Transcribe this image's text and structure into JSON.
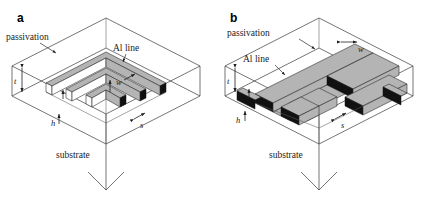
{
  "figure": {
    "kind": "schematic-diagram",
    "colors": {
      "line_top": "#b4b4b4",
      "line_front": "#111111",
      "line_side": "#ffffff",
      "outline": "#2e2e2e",
      "text": "#1a1a1a",
      "background": "#ffffff"
    }
  },
  "panels": [
    {
      "letter": "a",
      "layout": "nested-square-serpentine",
      "labels": {
        "passivation": "passivation",
        "al_line": "Al line",
        "substrate": "substrate"
      },
      "dimensions": {
        "thickness": "t",
        "width": "w",
        "height": "h",
        "spacing": "s"
      }
    },
    {
      "letter": "b",
      "layout": "parallel-straight-serpentine",
      "labels": {
        "passivation": "passivation",
        "al_line": "Al line",
        "substrate": "substrate"
      },
      "dimensions": {
        "thickness": "t",
        "width": "w",
        "height": "h",
        "spacing": "s"
      }
    }
  ]
}
